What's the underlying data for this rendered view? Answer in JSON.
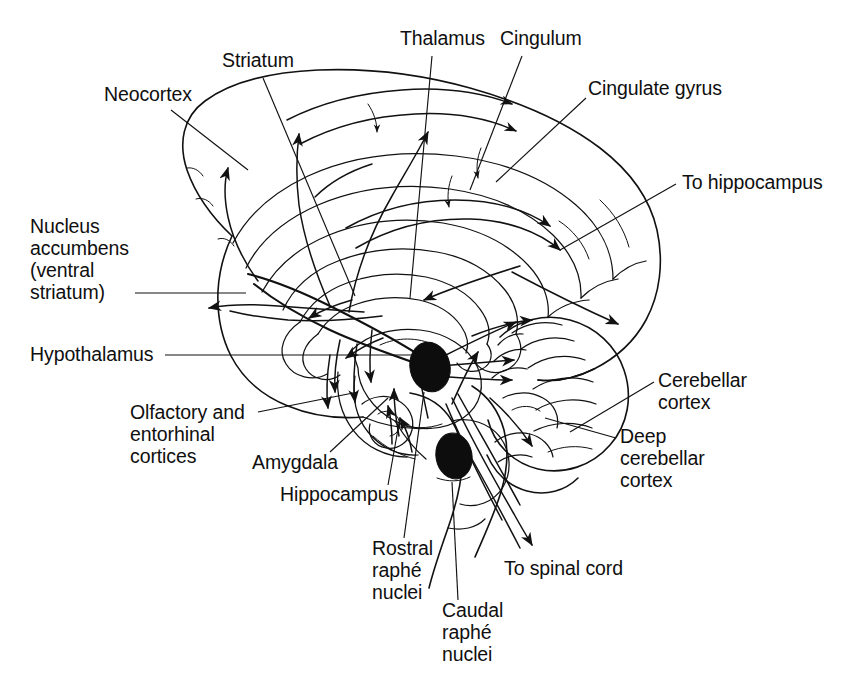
{
  "figure": {
    "background_color": "#ffffff",
    "ink_color": "#111111",
    "structure_marker_color": "#0d0d0d"
  },
  "labels": {
    "neocortex": "Neocortex",
    "striatum": "Striatum",
    "thalamus": "Thalamus",
    "cingulum": "Cingulum",
    "cingulate_gyrus": "Cingulate gyrus",
    "to_hippocampus": "To hippocampus",
    "nucleus_accumbens_l1": "Nucleus",
    "nucleus_accumbens_l2": "accumbens",
    "nucleus_accumbens_l3": "(ventral",
    "nucleus_accumbens_l4": "striatum)",
    "hypothalamus": "Hypothalamus",
    "olfactory_l1": "Olfactory and",
    "olfactory_l2": "entorhinal",
    "olfactory_l3": "cortices",
    "amygdala": "Amygdala",
    "hippocampus": "Hippocampus",
    "rostral_raphe_l1": "Rostral",
    "rostral_raphe_l2": "raphé",
    "rostral_raphe_l3": "nuclei",
    "caudal_raphe_l1": "Caudal",
    "caudal_raphe_l2": "raphé",
    "caudal_raphe_l3": "nuclei",
    "to_spinal_cord": "To spinal cord",
    "cerebellar_cortex_l1": "Cerebellar",
    "cerebellar_cortex_l2": "cortex",
    "deep_cerebellar_l1": "Deep",
    "deep_cerebellar_l2": "cerebellar",
    "deep_cerebellar_l3": "cortex"
  }
}
